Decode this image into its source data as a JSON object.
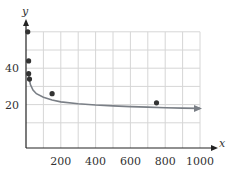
{
  "chart_data": {
    "type": "scatter",
    "title": "",
    "xlabel": "x",
    "ylabel": "y",
    "xlim": [
      0,
      1000
    ],
    "ylim": [
      0,
      60
    ],
    "grid": true,
    "x_ticks": [
      200,
      400,
      600,
      800,
      1000
    ],
    "x_tick_labels": [
      "200",
      "400",
      "600",
      "800",
      "1000"
    ],
    "y_ticks": [
      20,
      40
    ],
    "y_tick_labels": [
      "20",
      "40"
    ],
    "x_grid_step": 100,
    "y_grid_step": 10,
    "series": [
      {
        "name": "data points",
        "kind": "scatter",
        "x": [
          10,
          15,
          15,
          20,
          150,
          750
        ],
        "y": [
          60,
          44,
          37,
          34,
          26,
          21
        ]
      },
      {
        "name": "fitted curve",
        "kind": "line",
        "description": "decreasing power-law-like fit curve with arrowhead at right end",
        "x": [
          15,
          25,
          40,
          60,
          100,
          150,
          200,
          300,
          400,
          500,
          600,
          700,
          800,
          900,
          1000
        ],
        "y": [
          36,
          31,
          28,
          26,
          24,
          22.5,
          21.5,
          20.5,
          19.8,
          19.3,
          18.9,
          18.6,
          18.3,
          18.1,
          17.9
        ]
      }
    ],
    "colors": {
      "points": "#333333",
      "curve": "#7a7f86",
      "grid": "#d6d6d6",
      "axis": "#222222"
    }
  }
}
